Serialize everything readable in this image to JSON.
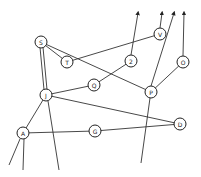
{
  "diagram": {
    "type": "hand-drawn graph",
    "nodes": [
      {
        "id": "S",
        "label": "S",
        "x": 41,
        "y": 42,
        "r": 6
      },
      {
        "id": "T",
        "label": "T",
        "x": 67,
        "y": 62,
        "r": 6
      },
      {
        "id": "2",
        "label": "2",
        "x": 131,
        "y": 61,
        "r": 6
      },
      {
        "id": "V",
        "label": "V",
        "x": 160,
        "y": 34,
        "r": 6
      },
      {
        "id": "O",
        "label": "O",
        "x": 183,
        "y": 62,
        "r": 6
      },
      {
        "id": "Q",
        "label": "Q",
        "x": 94,
        "y": 85,
        "r": 6
      },
      {
        "id": "J",
        "label": "J",
        "x": 46,
        "y": 95,
        "r": 6
      },
      {
        "id": "P",
        "label": "P",
        "x": 151,
        "y": 92,
        "r": 6
      },
      {
        "id": "A",
        "label": "A",
        "x": 23,
        "y": 133,
        "r": 6
      },
      {
        "id": "G",
        "label": "G",
        "x": 95,
        "y": 131,
        "r": 6
      },
      {
        "id": "D",
        "label": "D",
        "x": 180,
        "y": 124,
        "r": 6
      }
    ],
    "edges": [
      {
        "from": "S",
        "to": "T"
      },
      {
        "from": "S",
        "to": "P"
      },
      {
        "from": "S",
        "to": "J",
        "double": true
      },
      {
        "from": "T",
        "to": "V"
      },
      {
        "from": "J",
        "to": "Q"
      },
      {
        "from": "Q",
        "to": "2"
      },
      {
        "from": "J",
        "to": "D"
      },
      {
        "from": "J",
        "to": "A"
      },
      {
        "from": "A",
        "to": "G"
      },
      {
        "from": "G",
        "to": "D"
      },
      {
        "from": "P",
        "to": "O"
      }
    ],
    "arrows_up": [
      {
        "from": "2",
        "x1": 131,
        "y1": 55,
        "x2": 138,
        "y2": 13
      },
      {
        "from": "V",
        "x1": 160,
        "y1": 28,
        "x2": 162,
        "y2": 13
      },
      {
        "from": "P",
        "x1": 151,
        "y1": 86,
        "x2": 174,
        "y2": 13
      },
      {
        "from": "O",
        "x1": 183,
        "y1": 56,
        "x2": 184,
        "y2": 13
      }
    ],
    "dangling_lines": [
      {
        "from": "A",
        "x1": 20,
        "y1": 139,
        "x2": 9,
        "y2": 165
      },
      {
        "from": "A",
        "x1": 24,
        "y1": 139,
        "x2": 23,
        "y2": 170
      },
      {
        "from": "J",
        "x1": 48,
        "y1": 101,
        "x2": 59,
        "y2": 170
      },
      {
        "from": "P",
        "x1": 150,
        "y1": 98,
        "x2": 141,
        "y2": 163
      }
    ]
  }
}
